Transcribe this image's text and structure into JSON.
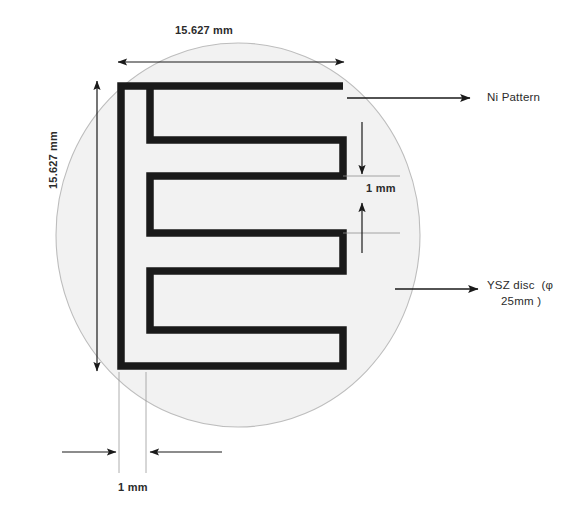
{
  "figure": {
    "background_color": "#ffffff",
    "ink_color": "#1a1a1a",
    "disc_fill": "#f2f2f2",
    "disc_stroke": "#b9b9b9"
  },
  "dimensions": {
    "top_width": "15.627 mm",
    "left_height": "15.627 mm",
    "gap": "1 mm",
    "trace_width": "1 mm"
  },
  "callouts": {
    "ni_pattern": "Ni Pattern",
    "ysz_disc_line1": "YSZ disc  (φ",
    "ysz_disc_line2": "25mm )"
  }
}
